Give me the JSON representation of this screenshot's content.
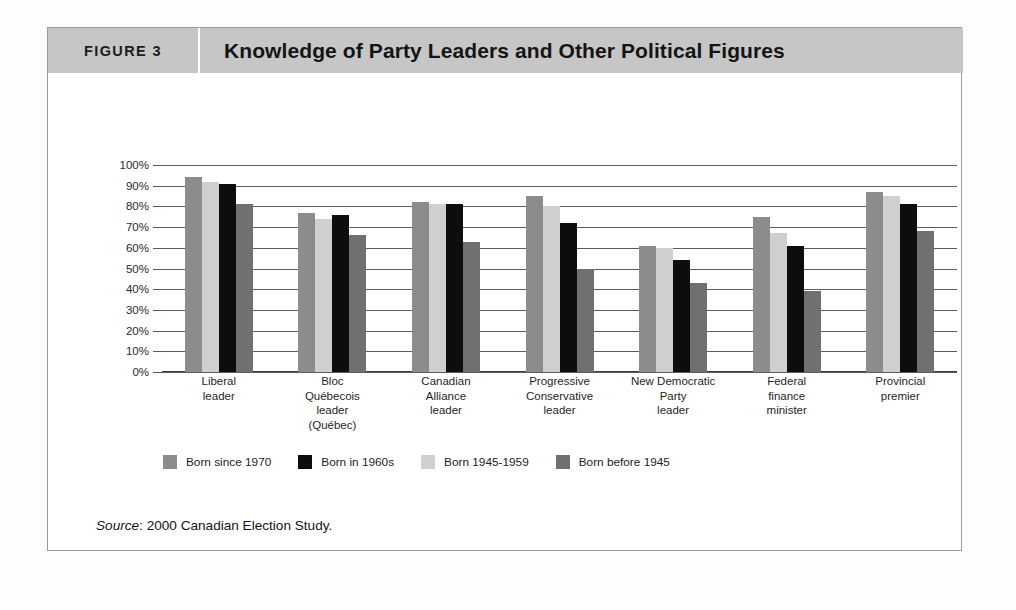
{
  "figure": {
    "number_label": "FIGURE 3",
    "title": "Knowledge of Party Leaders and Other Political Figures",
    "source_prefix": "Source",
    "source_text": ": 2000 Canadian Election Study."
  },
  "chart_data": {
    "type": "bar",
    "title": "Knowledge of Party Leaders and Other Political Figures",
    "xlabel": "",
    "ylabel": "",
    "ylim": [
      0,
      100
    ],
    "grid": true,
    "legend_position": "bottom-left",
    "y_ticks": [
      "0%",
      "10%",
      "20%",
      "30%",
      "40%",
      "50%",
      "60%",
      "70%",
      "80%",
      "90%",
      "100%"
    ],
    "categories": [
      "Liberal\nleader",
      "Bloc\nQuébecois\nleader\n(Québec)",
      "Canadian\nAlliance\nleader",
      "Progressive\nConservative\nleader",
      "New Democratic\nParty\nleader",
      "Federal\nfinance\nminister",
      "Provincial\npremier"
    ],
    "series": [
      {
        "name": "Born since 1970",
        "color": "#8c8c8c",
        "values": [
          94,
          77,
          82,
          85,
          61,
          75,
          87
        ]
      },
      {
        "name": "Born 1945-1959",
        "color": "#cfcfcf",
        "values": [
          92,
          74,
          81,
          80,
          60,
          67,
          85
        ]
      },
      {
        "name": "Born in 1960s",
        "color": "#0d0d0d",
        "values": [
          91,
          76,
          81,
          72,
          54,
          61,
          81
        ]
      },
      {
        "name": "Born before 1945",
        "color": "#707070",
        "values": [
          81,
          66,
          63,
          50,
          43,
          39,
          68
        ]
      }
    ],
    "legend_order": [
      {
        "name": "Born since 1970",
        "color": "#8c8c8c"
      },
      {
        "name": "Born in 1960s",
        "color": "#0d0d0d"
      },
      {
        "name": "Born 1945-1959",
        "color": "#cfcfcf"
      },
      {
        "name": "Born before 1945",
        "color": "#707070"
      }
    ],
    "bar_draw_order": [
      0,
      1,
      2,
      3
    ]
  },
  "colors": {
    "title_bar_bg": "#c6c6c6",
    "frame_border": "#9a9a9a",
    "gridline": "#5d5d5d",
    "page_bg": "#fdfdfb"
  }
}
